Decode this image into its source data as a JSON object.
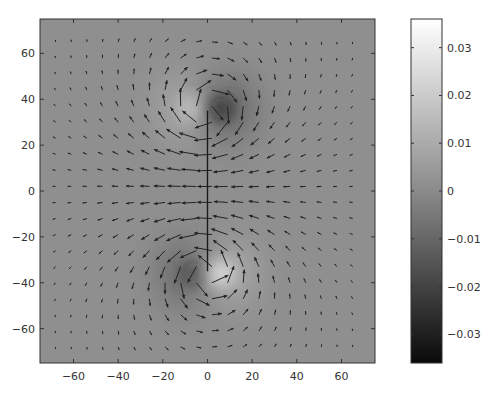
{
  "chart_data": {
    "type": "heatmap",
    "subtype": "heatmap_with_quiver",
    "title": "",
    "xlabel": "",
    "ylabel": "",
    "xlim": [
      -75,
      75
    ],
    "ylim": [
      -75,
      75
    ],
    "xticks": [
      -60,
      -40,
      -20,
      0,
      20,
      40,
      60
    ],
    "yticks": [
      -60,
      -40,
      -20,
      0,
      20,
      40,
      60
    ],
    "xtick_labels": [
      "−60",
      "−40",
      "−20",
      "0",
      "20",
      "40",
      "60"
    ],
    "ytick_labels": [
      "−60",
      "−40",
      "−20",
      "0",
      "20",
      "40",
      "60"
    ],
    "grid": false,
    "colormap": "gray",
    "colorbar": {
      "range": [
        -0.036,
        0.036
      ],
      "ticks": [
        0.03,
        0.02,
        0.01,
        0,
        -0.01,
        -0.02,
        -0.03
      ],
      "tick_labels": [
        "0.03",
        "0.02",
        "0.01",
        "0",
        "−0.01",
        "−0.02",
        "−0.03"
      ]
    },
    "line_segment": {
      "x": [
        0,
        0
      ],
      "y": [
        -35,
        35
      ],
      "color": "#1a1a1a"
    },
    "sources": [
      {
        "x": -6,
        "y": 36,
        "sign": 1,
        "label": "bright spot (top-left of segment end)"
      },
      {
        "x": 6,
        "y": 36,
        "sign": -1,
        "label": "dark spot (top-right of segment end)"
      },
      {
        "x": -6,
        "y": -36,
        "sign": -1,
        "label": "dark spot (bottom-left of segment end)"
      },
      {
        "x": 6,
        "y": -36,
        "sign": 1,
        "label": "bright spot (bottom-right of segment end)"
      }
    ],
    "quiver": {
      "grid_spacing": 7,
      "x_start": -68,
      "y_start": -68,
      "count": 20,
      "color": "#222222",
      "description": "Vector field circulating around segment ends: arrows point right near top end, left near bottom end; downward on left side, upward on right side."
    }
  }
}
